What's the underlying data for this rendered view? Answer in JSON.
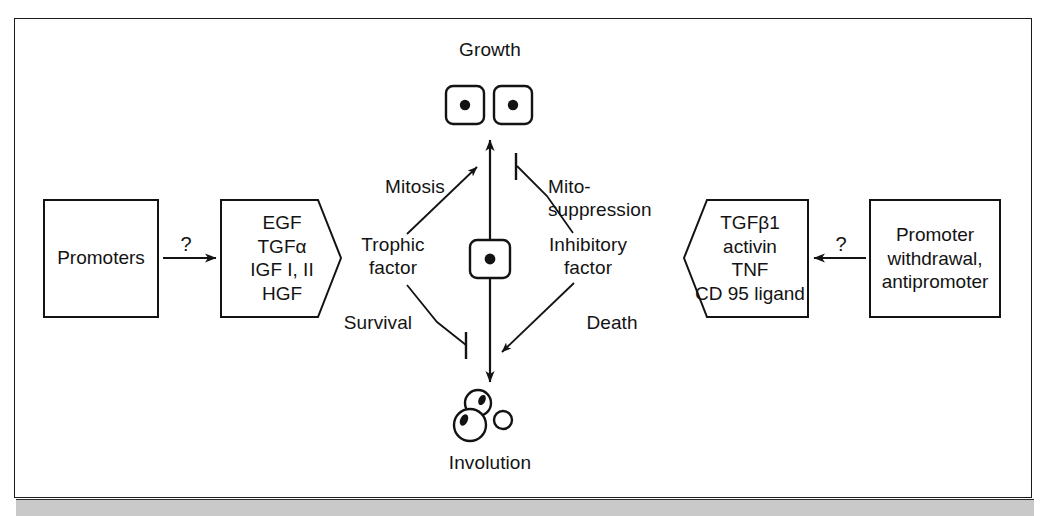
{
  "figure": {
    "type": "biological-signaling-diagram"
  },
  "nodes": {
    "growth_label": "Growth",
    "involution_label": "Involution",
    "trophic_factor": "Trophic\nfactor",
    "inhibitory_factor": "Inhibitory\nfactor",
    "promoters_box": "Promoters",
    "promoter_withdrawal_box": "Promoter\nwithdrawal,\nantipromoter",
    "growth_factors_pentagon": "EGF\nTGFα\nIGF I, II\nHGF",
    "inhibitory_factors_pentagon": "TGFβ1\nactivin\nTNF\nCD 95 ligand"
  },
  "edges": {
    "mitosis": "Mitosis",
    "mito_suppression": "Mito-\nsuppression",
    "survival": "Survival",
    "death": "Death",
    "left_question": "?",
    "right_question": "?"
  },
  "cells": {
    "growth_cell_count": 2,
    "central_cell_count": 1,
    "involution_body_count": 3
  },
  "colors": {
    "ink": "#131313",
    "stroke": "#1a1a1a",
    "background": "#ffffff",
    "scan_band": "#c9c9c9"
  }
}
